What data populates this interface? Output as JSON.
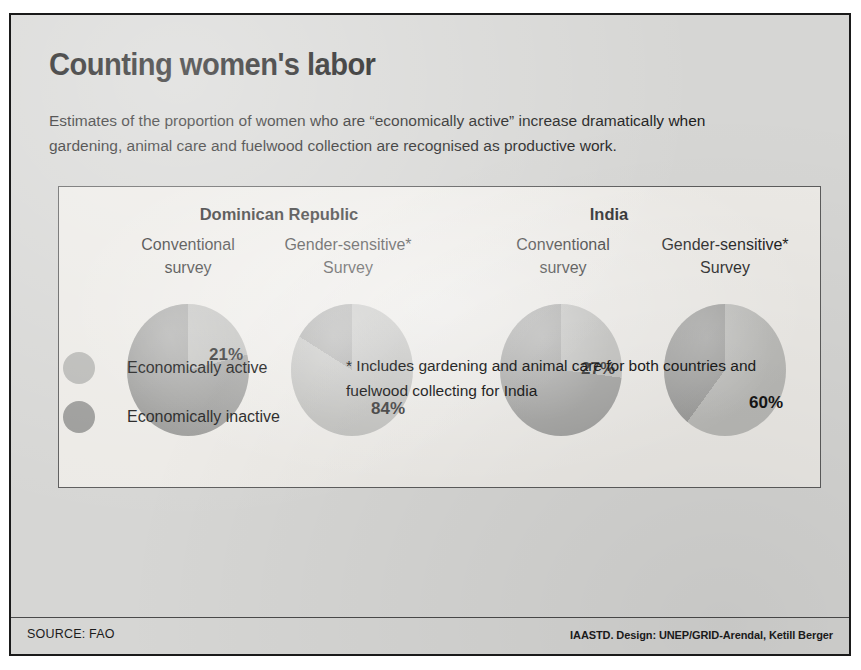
{
  "poster": {
    "title": "Counting women's labor",
    "subtitle_lines": [
      "Estimates of the proportion of women who are “economically  active” increase dramatically when",
      "gardening, animal care and fuelwood collection are recognised as productive work."
    ],
    "source_left": "SOURCE: FAO",
    "source_right": "IAASTD. Design: UNEP/GRID-Arendal, Ketill Berger",
    "footnote_lines": [
      "* Includes gardening and animal care for both countries and",
      "fuelwood collecting for India"
    ]
  },
  "legend": {
    "items": [
      {
        "label": "Economically active",
        "color": "#b9b9b6"
      },
      {
        "label": "Economically inactive",
        "color": "#9a9a98"
      }
    ]
  },
  "colors": {
    "active": "#b9b9b6",
    "inactive": "#9a9a98",
    "card_bg": "#d6d6d4",
    "panel_bg": "#eceae6",
    "border": "#1a1a1a",
    "text": "#1c1c1c"
  },
  "groups": [
    {
      "country": "Dominican Republic"
    },
    {
      "country": "India"
    }
  ],
  "surveys": [
    {
      "line1": "Conventional",
      "line2": "survey"
    },
    {
      "line1": "Gender-sensitive*",
      "line2": "Survey"
    },
    {
      "line1": "Conventional",
      "line2": "survey"
    },
    {
      "line1": "Gender-sensitive*",
      "line2": "Survey"
    }
  ],
  "pie_labels": [
    "21%",
    "84%",
    "27%",
    "60%"
  ],
  "chart_data": {
    "type": "pie",
    "title": "Counting women's labor",
    "subtitle": "Estimates of the proportion of women who are “economically  active” increase dramatically when gardening, animal care and fuelwood collection are recognised as productive work.",
    "legend": [
      "Economically active",
      "Economically inactive"
    ],
    "legend_position": "bottom-left",
    "note": "* Includes gardening and animal care for both countries and fuelwood collecting for India",
    "source": "SOURCE: FAO",
    "credit": "IAASTD. Design: UNEP/GRID-Arendal, Ketill Berger",
    "units": "percent",
    "charts": [
      {
        "country": "Dominican Republic",
        "survey": "Conventional survey",
        "labels": [
          "Economically active",
          "Economically inactive"
        ],
        "values": [
          21,
          79
        ],
        "data_label": "21%"
      },
      {
        "country": "Dominican Republic",
        "survey": "Gender-sensitive* Survey",
        "labels": [
          "Economically active",
          "Economically inactive"
        ],
        "values": [
          84,
          16
        ],
        "data_label": "84%"
      },
      {
        "country": "India",
        "survey": "Conventional survey",
        "labels": [
          "Economically active",
          "Economically inactive"
        ],
        "values": [
          27,
          73
        ],
        "data_label": "27%"
      },
      {
        "country": "India",
        "survey": "Gender-sensitive* Survey",
        "labels": [
          "Economically active",
          "Economically inactive"
        ],
        "values": [
          60,
          40
        ],
        "data_label": "60%"
      }
    ]
  }
}
